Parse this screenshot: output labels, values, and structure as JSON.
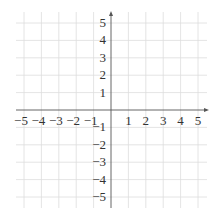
{
  "chart_data": {
    "type": "scatter",
    "title": "",
    "xlabel": "",
    "ylabel": "",
    "xlim": [
      -5,
      5
    ],
    "ylim": [
      -5,
      5
    ],
    "grid": true,
    "x_ticks": [
      "−5",
      "−4",
      "−3",
      "−2",
      "−1",
      "1",
      "2",
      "3",
      "4",
      "5"
    ],
    "y_ticks": [
      "5",
      "4",
      "3",
      "2",
      "1",
      "−1",
      "−2",
      "−3",
      "−4",
      "−5"
    ],
    "series": [],
    "colors": {
      "grid": "#dddddd",
      "axis": "#555555",
      "text": "#333333"
    }
  }
}
